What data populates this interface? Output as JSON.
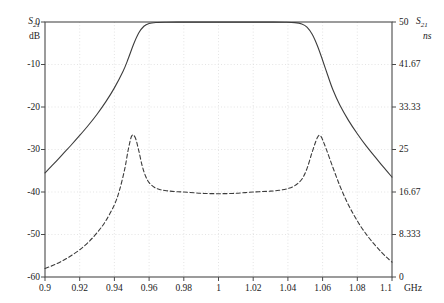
{
  "chart_data": {
    "type": "line",
    "title": "",
    "xlabel": "GHz",
    "x_unit": "GHz",
    "x": [
      0.9,
      0.92,
      0.94,
      0.96,
      0.98,
      1.0,
      1.02,
      1.04,
      1.06,
      1.08,
      1.1
    ],
    "xlim": [
      0.9,
      1.1
    ],
    "xticks": [
      "0.9",
      "0.92",
      "0.94",
      "0.96",
      "0.98",
      "1",
      "1.02",
      "1.04",
      "1.06",
      "1.08",
      "1.1"
    ],
    "x_axis_unit_label": "GHz",
    "grid": true,
    "grid_style": "dotted",
    "legend": "none",
    "axes": [
      {
        "side": "left",
        "symbol": "S21",
        "unit": "dB",
        "ylim": [
          -60,
          0
        ],
        "yticks": [
          "0",
          "-10",
          "-20",
          "-30",
          "-40",
          "-50",
          "-60"
        ],
        "ytick_values": [
          0,
          -10,
          -20,
          -30,
          -40,
          -50,
          -60
        ]
      },
      {
        "side": "right",
        "symbol": "S21",
        "unit": "ns",
        "ylim": [
          0,
          50
        ],
        "yticks": [
          "50",
          "41.67",
          "33.33",
          "25",
          "16.67",
          "8.333",
          "0"
        ],
        "ytick_values": [
          50,
          41.67,
          33.33,
          25,
          16.67,
          8.333,
          0
        ]
      }
    ],
    "series": [
      {
        "name": "S21 magnitude",
        "axis": "left",
        "style": "solid",
        "color": "#3c3c3c",
        "points": [
          [
            0.9,
            -35.5
          ],
          [
            0.905,
            -33.4
          ],
          [
            0.91,
            -31.2
          ],
          [
            0.915,
            -29.0
          ],
          [
            0.92,
            -26.7
          ],
          [
            0.925,
            -24.3
          ],
          [
            0.93,
            -21.7
          ],
          [
            0.935,
            -18.8
          ],
          [
            0.94,
            -15.5
          ],
          [
            0.945,
            -11.6
          ],
          [
            0.948,
            -8.6
          ],
          [
            0.951,
            -5.3
          ],
          [
            0.954,
            -2.6
          ],
          [
            0.957,
            -1.0
          ],
          [
            0.96,
            -0.35
          ],
          [
            0.964,
            -0.12
          ],
          [
            0.97,
            -0.05
          ],
          [
            0.98,
            -0.02
          ],
          [
            0.99,
            -0.02
          ],
          [
            1.0,
            -0.02
          ],
          [
            1.01,
            -0.02
          ],
          [
            1.02,
            -0.02
          ],
          [
            1.03,
            -0.03
          ],
          [
            1.038,
            -0.06
          ],
          [
            1.044,
            -0.15
          ],
          [
            1.048,
            -0.45
          ],
          [
            1.051,
            -1.2
          ],
          [
            1.054,
            -2.9
          ],
          [
            1.057,
            -5.6
          ],
          [
            1.06,
            -9.0
          ],
          [
            1.063,
            -12.6
          ],
          [
            1.066,
            -16.0
          ],
          [
            1.07,
            -19.6
          ],
          [
            1.075,
            -23.2
          ],
          [
            1.08,
            -26.3
          ],
          [
            1.085,
            -29.1
          ],
          [
            1.09,
            -31.6
          ],
          [
            1.095,
            -34.1
          ],
          [
            1.1,
            -36.5
          ]
        ]
      },
      {
        "name": "S21 group delay",
        "axis": "left-mapped",
        "style": "dashed",
        "color": "#3c3c3c",
        "points": [
          [
            0.9,
            -58.0
          ],
          [
            0.905,
            -57.2
          ],
          [
            0.91,
            -56.2
          ],
          [
            0.915,
            -55.0
          ],
          [
            0.92,
            -53.6
          ],
          [
            0.925,
            -51.8
          ],
          [
            0.93,
            -49.6
          ],
          [
            0.935,
            -46.8
          ],
          [
            0.94,
            -43.0
          ],
          [
            0.943,
            -39.5
          ],
          [
            0.946,
            -34.5
          ],
          [
            0.948,
            -30.0
          ],
          [
            0.95,
            -26.8
          ],
          [
            0.952,
            -27.2
          ],
          [
            0.954,
            -30.2
          ],
          [
            0.956,
            -33.8
          ],
          [
            0.958,
            -36.3
          ],
          [
            0.96,
            -37.8
          ],
          [
            0.963,
            -38.9
          ],
          [
            0.966,
            -39.4
          ],
          [
            0.97,
            -39.7
          ],
          [
            0.975,
            -39.9
          ],
          [
            0.98,
            -40.0
          ],
          [
            0.99,
            -40.3
          ],
          [
            1.0,
            -40.4
          ],
          [
            1.01,
            -40.3
          ],
          [
            1.02,
            -40.0
          ],
          [
            1.03,
            -39.8
          ],
          [
            1.035,
            -39.6
          ],
          [
            1.04,
            -39.2
          ],
          [
            1.044,
            -38.5
          ],
          [
            1.048,
            -37.0
          ],
          [
            1.051,
            -34.5
          ],
          [
            1.054,
            -30.6
          ],
          [
            1.057,
            -27.2
          ],
          [
            1.059,
            -26.9
          ],
          [
            1.062,
            -29.8
          ],
          [
            1.066,
            -34.3
          ],
          [
            1.07,
            -38.6
          ],
          [
            1.074,
            -42.3
          ],
          [
            1.078,
            -45.4
          ],
          [
            1.082,
            -48.1
          ],
          [
            1.086,
            -50.4
          ],
          [
            1.09,
            -52.4
          ],
          [
            1.094,
            -54.2
          ],
          [
            1.097,
            -55.4
          ],
          [
            1.1,
            -56.5
          ]
        ]
      }
    ],
    "annotations": {
      "left_axis_symbol": "S",
      "left_axis_subscript": "21",
      "left_axis_unit": "dB",
      "right_axis_symbol": "S",
      "right_axis_subscript": "21",
      "right_axis_unit": "ns"
    }
  },
  "layout": {
    "plot_left": 45,
    "plot_right": 392,
    "plot_top": 22,
    "plot_bottom": 277,
    "background": "#ffffff",
    "frame_color": "#4a4a4a",
    "grid_color": "#d8d8d8"
  }
}
